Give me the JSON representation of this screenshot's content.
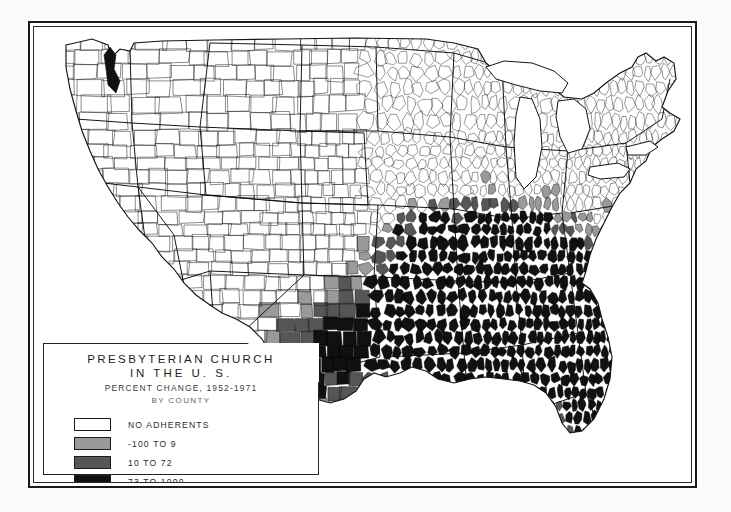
{
  "figure": {
    "kind": "choropleth-map",
    "background": "#ffffff",
    "frame_color": "#1a1a1a"
  },
  "legend": {
    "title_line1": "PRESBYTERIAN CHURCH",
    "title_line2": "IN THE U. S.",
    "subtitle": "PERCENT CHANGE, 1952-1971",
    "unit_line": "BY COUNTY",
    "classes": [
      {
        "label": "NO ADHERENTS",
        "color": "#ffffff"
      },
      {
        "label": "-100 TO 9",
        "color": "#9a9a9a"
      },
      {
        "label": "10 TO 72",
        "color": "#565656"
      },
      {
        "label": "73 TO 1000",
        "color": "#111111"
      }
    ]
  },
  "chart_data": {
    "type": "map",
    "title": "PRESBYTERIAN CHURCH IN THE U. S.",
    "subtitle": "PERCENT CHANGE, 1952-1971",
    "unit": "BY COUNTY",
    "geography": "United States, conterminous 48 states, county level",
    "variable": "Percent change in Presbyterian Church in the U.S. adherents, 1952-1971",
    "legend_position": "lower-left",
    "grid": false,
    "class_breaks": [
      {
        "label": "NO ADHERENTS",
        "min": null,
        "max": null,
        "color": "#ffffff"
      },
      {
        "label": "-100 TO 9",
        "min": -100,
        "max": 9,
        "color": "#9a9a9a"
      },
      {
        "label": "10 TO 72",
        "min": 10,
        "max": 72,
        "color": "#565656"
      },
      {
        "label": "73 TO 1000",
        "min": 73,
        "max": 1000,
        "color": "#111111"
      }
    ],
    "regions": [
      {
        "name": "Pacific Northwest",
        "dominant_class": "NO ADHERENTS"
      },
      {
        "name": "Mountain West",
        "dominant_class": "NO ADHERENTS"
      },
      {
        "name": "Upper Midwest",
        "dominant_class": "NO ADHERENTS"
      },
      {
        "name": "Great Lakes",
        "dominant_class": "NO ADHERENTS"
      },
      {
        "name": "Northeast",
        "dominant_class": "NO ADHERENTS"
      },
      {
        "name": "Missouri / Arkansas",
        "dominant_class": "73 TO 1000"
      },
      {
        "name": "Texas",
        "dominant_class": "-100 TO 9"
      },
      {
        "name": "Deep South",
        "dominant_class": "73 TO 1000"
      },
      {
        "name": "Appalachia / Carolinas",
        "dominant_class": "73 TO 1000"
      },
      {
        "name": "Florida",
        "dominant_class": "73 TO 1000"
      }
    ]
  },
  "mosaic": {
    "seed": 20517,
    "note": "Procedural county fill field reproducing the Presbyterian U.S. core concentrated in the South and lower Midwest."
  }
}
